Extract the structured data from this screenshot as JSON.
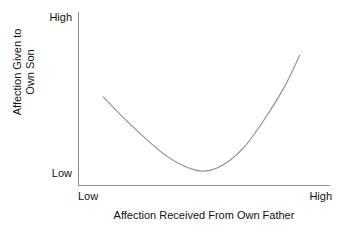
{
  "chart_data": {
    "type": "line",
    "title": "",
    "xlabel": "Affection Received From Own Father",
    "ylabel_line1": "Affection Given to",
    "ylabel_line2": "Own Son",
    "x_tick_labels": [
      "Low",
      "High"
    ],
    "y_tick_labels": [
      "Low",
      "High"
    ],
    "xlim": [
      "Low",
      "High"
    ],
    "ylim": [
      "Low",
      "High"
    ],
    "grid": false,
    "legend": false,
    "series": [
      {
        "name": "Affection Given to Own Son",
        "shape": "u-curve",
        "description": "U-shaped curve: starts mid-high at low paternal affection, drops to a minimum near the lower-middle of the x range, then rises steeply to high at high paternal affection",
        "points": [
          {
            "x": 0.1,
            "y": 0.51
          },
          {
            "x": 0.18,
            "y": 0.39
          },
          {
            "x": 0.26,
            "y": 0.28
          },
          {
            "x": 0.34,
            "y": 0.18
          },
          {
            "x": 0.42,
            "y": 0.11
          },
          {
            "x": 0.5,
            "y": 0.08
          },
          {
            "x": 0.58,
            "y": 0.12
          },
          {
            "x": 0.66,
            "y": 0.22
          },
          {
            "x": 0.74,
            "y": 0.38
          },
          {
            "x": 0.82,
            "y": 0.57
          },
          {
            "x": 0.88,
            "y": 0.75
          }
        ]
      }
    ],
    "line_color": "#8d8d8d",
    "axis_color": "#8d8d8d",
    "background_color": "#ffffff"
  }
}
